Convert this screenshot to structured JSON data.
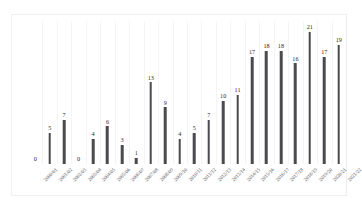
{
  "chart_data": {
    "type": "bar",
    "title": "",
    "subtitle": "",
    "xlabel": "",
    "ylabel": "",
    "ylim": [
      0,
      21
    ],
    "grid": "vertical",
    "legend": "none",
    "bar_color": "#4a4a4f",
    "gridline_color": "#f4f4f6",
    "border_color": "#efeff1",
    "background_color": "#ffffff",
    "label_rotation": -45,
    "categories": [
      "2000/01",
      "2001/02",
      "2002/03",
      "2003/04",
      "2004/05",
      "2005/06",
      "2006/07",
      "2007/08",
      "2008/09",
      "2009/10",
      "2010/11",
      "2011/12",
      "2012/13",
      "2013/14",
      "2014/15",
      "2015/16",
      "2016/17",
      "2017/18",
      "2018/19",
      "2019/20",
      "2020/21",
      "2021/22"
    ],
    "values": [
      0,
      5,
      7,
      0,
      4,
      6,
      3,
      1,
      13,
      9,
      4,
      5,
      7,
      10,
      11,
      17,
      18,
      18,
      16,
      21,
      17,
      19
    ],
    "data_labels": [
      "0",
      "5",
      "7",
      "0",
      "4",
      "6",
      "3",
      "1",
      "13",
      "9",
      "4",
      "5",
      "7",
      "10",
      "11",
      "17",
      "18",
      "18",
      "16",
      "21",
      "17",
      "19"
    ]
  }
}
